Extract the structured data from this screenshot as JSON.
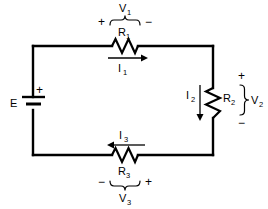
{
  "diagram": {
    "background_color": "#ffffff",
    "line_color": "#000000"
  },
  "source": {
    "name": "E",
    "label": "E",
    "polarity_label": "+",
    "type": "battery"
  },
  "components": [
    {
      "id": "R1",
      "label": "R₁",
      "label_text": "R",
      "subscript": "1",
      "position": "top",
      "orientation": "horizontal",
      "voltage_label": "V₁",
      "voltage_text": "V",
      "voltage_sub": "1",
      "polarity_left": "+",
      "polarity_right": "−",
      "current_label": "I₁",
      "current_text": "I",
      "current_sub": "1",
      "current_direction": "right"
    },
    {
      "id": "R2",
      "label": "R₂",
      "label_text": "R",
      "subscript": "2",
      "position": "right",
      "orientation": "vertical",
      "voltage_label": "V₂",
      "voltage_text": "V",
      "voltage_sub": "2",
      "polarity_top": "+",
      "polarity_bottom": "−",
      "current_label": "I₂",
      "current_text": "I",
      "current_sub": "2",
      "current_direction": "down"
    },
    {
      "id": "R3",
      "label": "R₃",
      "label_text": "R",
      "subscript": "3",
      "position": "bottom",
      "orientation": "horizontal",
      "voltage_label": "V₃",
      "voltage_text": "V",
      "voltage_sub": "3",
      "polarity_left": "−",
      "polarity_right": "+",
      "current_label": "I₃",
      "current_text": "I",
      "current_sub": "3",
      "current_direction": "left"
    }
  ],
  "labels": {
    "v1": "V",
    "v1_sub": "1",
    "r1": "R",
    "r1_sub": "1",
    "i1": "I",
    "i1_sub": "1",
    "plus_top_left": "+",
    "minus_top_right": "−",
    "e": "E",
    "battery_plus": "+",
    "i2": "I",
    "i2_sub": "2",
    "r2": "R",
    "r2_sub": "2",
    "v2": "V",
    "v2_sub": "2",
    "plus_right_top": "+",
    "minus_right_bottom": "−",
    "i3": "I",
    "i3_sub": "3",
    "r3": "R",
    "r3_sub": "3",
    "v3": "V",
    "v3_sub": "3",
    "minus_bottom_left": "−",
    "plus_bottom_right": "+"
  }
}
